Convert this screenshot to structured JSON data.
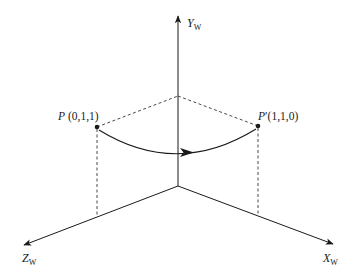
{
  "diagram": {
    "type": "3d-coordinate-rotation",
    "axes": {
      "y": {
        "name": "Y",
        "subscript": "W"
      },
      "x": {
        "name": "X",
        "subscript": "W"
      },
      "z": {
        "name": "Z",
        "subscript": "W"
      }
    },
    "points": [
      {
        "id": "P",
        "name": "P",
        "prime": "",
        "coords": "(0,1,1)"
      },
      {
        "id": "P_prime",
        "name": "P",
        "prime": "′",
        "coords": "(1,1,0)"
      }
    ],
    "transition": {
      "from": "P",
      "to": "P_prime",
      "style": "curved-arrow"
    },
    "colors": {
      "stroke": "#1a1a1a",
      "background": "#ffffff"
    }
  }
}
